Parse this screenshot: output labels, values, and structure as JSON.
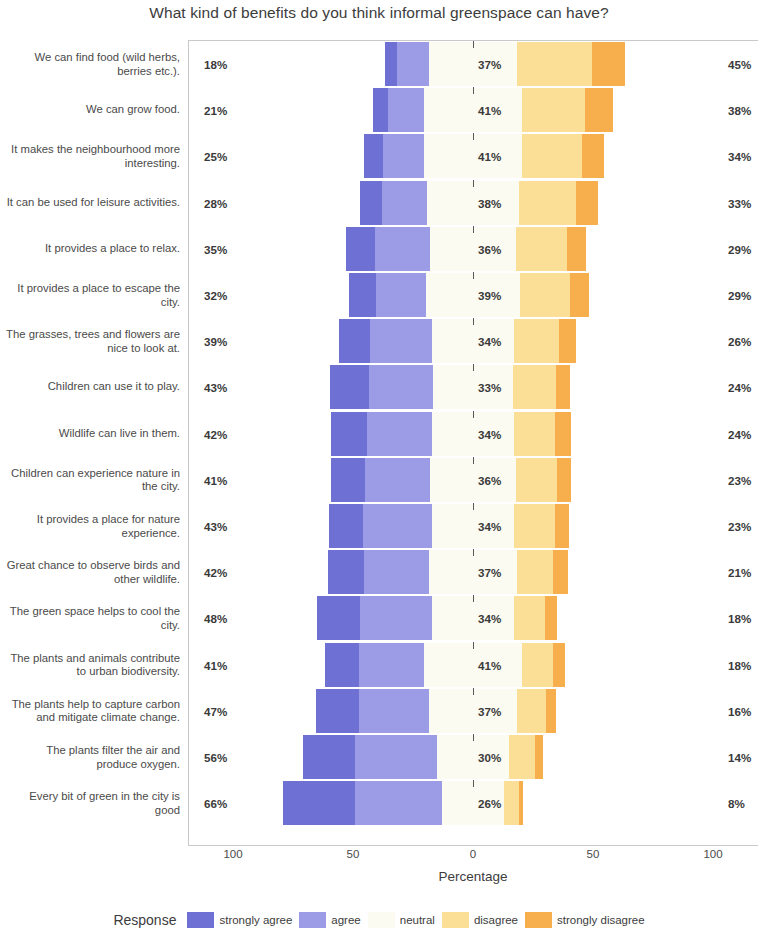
{
  "chart_data": {
    "type": "bar",
    "subtype": "diverging-stacked-likert",
    "title": "What kind of benefits do you think informal greenspace can have?",
    "xlabel": "Percentage",
    "ylabel": "",
    "xticks": [
      "100",
      "50",
      "0",
      "50",
      "100"
    ],
    "xtick_values": [
      -100,
      -50,
      0,
      50,
      100
    ],
    "xlim": [
      -100,
      100
    ],
    "grid": false,
    "legend_title": "Response",
    "legend_position": "bottom",
    "legend": [
      {
        "name": "strongly agree",
        "color": "#6f70d4"
      },
      {
        "name": "agree",
        "color": "#9b9be6"
      },
      {
        "name": "neutral",
        "color": "#fbfbf2"
      },
      {
        "name": "disagree",
        "color": "#fbdf96"
      },
      {
        "name": "strongly disagree",
        "color": "#f6af4c"
      }
    ],
    "series": [
      {
        "name": "strongly agree",
        "values": [
          5,
          6,
          8,
          9,
          12,
          11,
          13,
          16,
          15,
          14,
          14,
          15,
          18,
          14,
          18,
          22,
          30
        ]
      },
      {
        "name": "agree",
        "values": [
          13,
          15,
          17,
          19,
          23,
          21,
          26,
          27,
          27,
          27,
          29,
          27,
          30,
          27,
          29,
          34,
          36
        ]
      },
      {
        "name": "neutral",
        "values": [
          37,
          41,
          41,
          38,
          36,
          39,
          34,
          33,
          34,
          36,
          34,
          37,
          34,
          41,
          37,
          30,
          26
        ]
      },
      {
        "name": "disagree",
        "values": [
          31,
          26,
          25,
          24,
          21,
          21,
          19,
          18,
          17,
          17,
          17,
          15,
          13,
          13,
          12,
          11,
          6
        ]
      },
      {
        "name": "strongly disagree",
        "values": [
          14,
          12,
          9,
          9,
          8,
          8,
          7,
          6,
          7,
          6,
          6,
          6,
          5,
          5,
          4,
          3,
          2
        ]
      }
    ],
    "categories": [
      "We can find food (wild herbs, berries etc.).",
      "We can grow food.",
      "It makes the neighbourhood more interesting.",
      "It can be used for leisure activities.",
      "It provides a place to relax.",
      "It provides a place to escape the city.",
      "The grasses, trees and flowers are nice to look at.",
      "Children can use it to play.",
      "Wildlife can live in them.",
      "Children can experience nature in the city.",
      "It provides a place for nature experience.",
      "Great chance to observe birds and other wildlife.",
      "The green space helps to cool the city.",
      "The plants and animals contribute to urban biodiversity.",
      "The plants help to capture carbon and mitigate climate change.",
      "The plants filter the air and produce oxygen.",
      "Every bit of green in the city is good"
    ],
    "rows": [
      {
        "label": "We can find food (wild herbs, berries etc.).",
        "agree_total": "18%",
        "neutral": "37%",
        "disagree_total": "45%",
        "strongly_agree": 5,
        "agree": 13,
        "neutral_v": 37,
        "disagree": 31,
        "strongly_disagree": 14
      },
      {
        "label": "We can grow food.",
        "agree_total": "21%",
        "neutral": "41%",
        "disagree_total": "38%",
        "strongly_agree": 6,
        "agree": 15,
        "neutral_v": 41,
        "disagree": 26,
        "strongly_disagree": 12
      },
      {
        "label": "It makes the neighbourhood more interesting.",
        "agree_total": "25%",
        "neutral": "41%",
        "disagree_total": "34%",
        "strongly_agree": 8,
        "agree": 17,
        "neutral_v": 41,
        "disagree": 25,
        "strongly_disagree": 9
      },
      {
        "label": "It can be used for leisure activities.",
        "agree_total": "28%",
        "neutral": "38%",
        "disagree_total": "33%",
        "strongly_agree": 9,
        "agree": 19,
        "neutral_v": 38,
        "disagree": 24,
        "strongly_disagree": 9
      },
      {
        "label": "It provides a place to relax.",
        "agree_total": "35%",
        "neutral": "36%",
        "disagree_total": "29%",
        "strongly_agree": 12,
        "agree": 23,
        "neutral_v": 36,
        "disagree": 21,
        "strongly_disagree": 8
      },
      {
        "label": "It provides a place to escape the city.",
        "agree_total": "32%",
        "neutral": "39%",
        "disagree_total": "29%",
        "strongly_agree": 11,
        "agree": 21,
        "neutral_v": 39,
        "disagree": 21,
        "strongly_disagree": 8
      },
      {
        "label": "The grasses, trees and flowers are nice to look at.",
        "agree_total": "39%",
        "neutral": "34%",
        "disagree_total": "26%",
        "strongly_agree": 13,
        "agree": 26,
        "neutral_v": 34,
        "disagree": 19,
        "strongly_disagree": 7
      },
      {
        "label": "Children can use it to play.",
        "agree_total": "43%",
        "neutral": "33%",
        "disagree_total": "24%",
        "strongly_agree": 16,
        "agree": 27,
        "neutral_v": 33,
        "disagree": 18,
        "strongly_disagree": 6
      },
      {
        "label": "Wildlife can live in them.",
        "agree_total": "42%",
        "neutral": "34%",
        "disagree_total": "24%",
        "strongly_agree": 15,
        "agree": 27,
        "neutral_v": 34,
        "disagree": 17,
        "strongly_disagree": 7
      },
      {
        "label": "Children can experience nature in the city.",
        "agree_total": "41%",
        "neutral": "36%",
        "disagree_total": "23%",
        "strongly_agree": 14,
        "agree": 27,
        "neutral_v": 36,
        "disagree": 17,
        "strongly_disagree": 6
      },
      {
        "label": "It provides a place for nature experience.",
        "agree_total": "43%",
        "neutral": "34%",
        "disagree_total": "23%",
        "strongly_agree": 14,
        "agree": 29,
        "neutral_v": 34,
        "disagree": 17,
        "strongly_disagree": 6
      },
      {
        "label": "Great chance to observe birds and other wildlife.",
        "agree_total": "42%",
        "neutral": "37%",
        "disagree_total": "21%",
        "strongly_agree": 15,
        "agree": 27,
        "neutral_v": 37,
        "disagree": 15,
        "strongly_disagree": 6
      },
      {
        "label": "The green space helps to cool the city.",
        "agree_total": "48%",
        "neutral": "34%",
        "disagree_total": "18%",
        "strongly_agree": 18,
        "agree": 30,
        "neutral_v": 34,
        "disagree": 13,
        "strongly_disagree": 5
      },
      {
        "label": "The plants and animals contribute to urban biodiversity.",
        "agree_total": "41%",
        "neutral": "41%",
        "disagree_total": "18%",
        "strongly_agree": 14,
        "agree": 27,
        "neutral_v": 41,
        "disagree": 13,
        "strongly_disagree": 5
      },
      {
        "label": "The plants help to capture carbon and mitigate climate change.",
        "agree_total": "47%",
        "neutral": "37%",
        "disagree_total": "16%",
        "strongly_agree": 18,
        "agree": 29,
        "neutral_v": 37,
        "disagree": 12,
        "strongly_disagree": 4
      },
      {
        "label": "The plants filter the air and produce oxygen.",
        "agree_total": "56%",
        "neutral": "30%",
        "disagree_total": "14%",
        "strongly_agree": 22,
        "agree": 34,
        "neutral_v": 30,
        "disagree": 11,
        "strongly_disagree": 3
      },
      {
        "label": "Every bit of green in the city is good",
        "agree_total": "66%",
        "neutral": "26%",
        "disagree_total": "8%",
        "strongly_agree": 30,
        "agree": 36,
        "neutral_v": 26,
        "disagree": 6,
        "strongly_disagree": 2
      }
    ]
  }
}
